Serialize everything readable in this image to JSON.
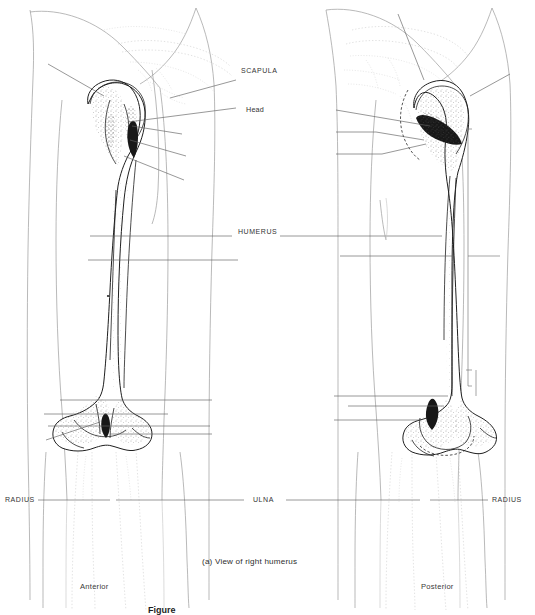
{
  "figure": {
    "domain_kind": "anatomical-line-drawing",
    "background_color": "#ffffff",
    "ink_color": "#2b2b2b",
    "faint_ink_color": "#b9b9b9",
    "leader_color": "#595959",
    "caption": "(a)  View of right humerus",
    "figure_number_partial": "Figure",
    "views": {
      "left_label": "Anterior",
      "right_label": "Posterior"
    },
    "labels": [
      {
        "id": "scapula",
        "text": "SCAPULA",
        "style": "caps",
        "x": 241,
        "y": 71,
        "side": "center"
      },
      {
        "id": "head",
        "text": "Head",
        "style": "mixed",
        "x": 246,
        "y": 110,
        "side": "center"
      },
      {
        "id": "humerus",
        "text": "HUMERUS",
        "style": "caps",
        "x": 238,
        "y": 232,
        "side": "center"
      },
      {
        "id": "ulna",
        "text": "ULNA",
        "style": "caps",
        "x": 253,
        "y": 500,
        "side": "center"
      },
      {
        "id": "radius-left",
        "text": "RADIUS",
        "style": "caps",
        "x": 5,
        "y": 500,
        "side": "left"
      },
      {
        "id": "radius-right",
        "text": "RADIUS",
        "style": "caps",
        "x": 492,
        "y": 500,
        "side": "right"
      }
    ],
    "unlabeled_leaders_note": "Numerous blank leader lines radiate from both humeri to the page margins",
    "left_bone": {
      "name": "humerus-anterior",
      "view": "Anterior",
      "regions": [
        "head",
        "greater-tubercle",
        "lesser-tubercle",
        "intertubercular-groove",
        "shaft",
        "medial-epicondyle",
        "lateral-epicondyle",
        "capitulum",
        "trochlea"
      ]
    },
    "right_bone": {
      "name": "humerus-posterior",
      "view": "Posterior",
      "regions": [
        "head",
        "greater-tubercle",
        "surgical-neck",
        "shaft",
        "olecranon-fossa",
        "medial-epicondyle",
        "lateral-epicondyle"
      ]
    },
    "brackets": [
      {
        "id": "shaft-bracket-right",
        "x": 468,
        "y_top": 129,
        "y_bottom": 386
      }
    ]
  }
}
